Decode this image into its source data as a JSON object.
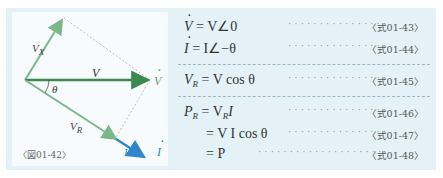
{
  "figure": {
    "label": "〈図01-42〉",
    "vectors": {
      "V": "V",
      "V_dot": "V",
      "V_X": "V",
      "V_X_sub": "X",
      "V_R": "V",
      "V_R_sub": "R",
      "I": "I",
      "I_dot": "I",
      "theta": "θ"
    },
    "colors": {
      "V": "#3a8a50",
      "V_light": "#7ab88a",
      "I": "#2f86c8",
      "dashed": "#c8a0a0"
    }
  },
  "equations": [
    {
      "lhs": "V",
      "dot": true,
      "rhs": " =  V∠0",
      "ref": "〈式01-43〉"
    },
    {
      "lhs": "I",
      "dot": true,
      "rhs": " =  I∠−θ",
      "ref": "〈式01-44〉"
    },
    {
      "lhs": "V",
      "sub": "R",
      "rhs": " = V cos θ",
      "ref": "〈式01-45〉"
    },
    {
      "lhs": "P",
      "sub": "R",
      "rhs": " = V",
      "rhs_sub": "R",
      "rhs_tail": "I",
      "ref": "〈式01-46〉"
    },
    {
      "lhs": "",
      "rhs": "= V I cos θ",
      "ref": "〈式01-47〉"
    },
    {
      "lhs": "",
      "rhs": "= P",
      "ref": "〈式01-48〉"
    }
  ],
  "dots": "··································"
}
